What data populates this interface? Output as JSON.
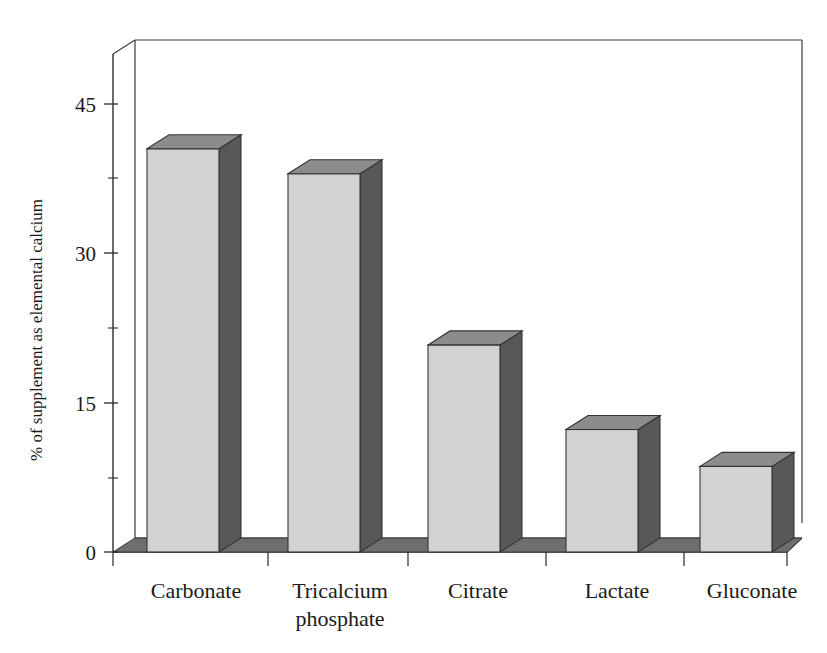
{
  "chart_data": {
    "type": "bar",
    "title": "",
    "subtitle": "",
    "xlabel": "",
    "ylabel": "% of supplement as elemental calcium",
    "categories": [
      "Carbonate",
      "Tricalcium phosphate",
      "Citrate",
      "Lactate",
      "Gluconate"
    ],
    "values": [
      40.5,
      38.0,
      20.8,
      12.3,
      8.6
    ],
    "series": [
      {
        "name": "% of supplement as elemental calcium",
        "values": [
          40.5,
          38.0,
          20.8,
          12.3,
          8.6
        ]
      }
    ],
    "ylim": [
      0,
      50
    ],
    "ytick_labels": [
      "0",
      "15",
      "30",
      "45"
    ],
    "ytick_values": [
      0,
      15,
      30,
      45
    ],
    "yminor_tick_values": [
      7.5,
      22.5,
      37.5
    ],
    "grid": false,
    "legend": false,
    "legend_position": "none",
    "style": "3d-column",
    "annotations": []
  },
  "axes": {
    "y_axis_label": "% of supplement as elemental calcium",
    "y_ticks": [
      {
        "label": "45",
        "value": 45
      },
      {
        "label": "30",
        "value": 30
      },
      {
        "label": "15",
        "value": 15
      },
      {
        "label": "0",
        "value": 0
      }
    ],
    "x_ticks": [
      {
        "label_line1": "Carbonate",
        "label_line2": ""
      },
      {
        "label_line1": "Tricalcium",
        "label_line2": "phosphate"
      },
      {
        "label_line1": "Citrate",
        "label_line2": ""
      },
      {
        "label_line1": "Lactate",
        "label_line2": ""
      },
      {
        "label_line1": "Gluconate",
        "label_line2": ""
      }
    ]
  },
  "colors": {
    "bar_front": "#d2d2d2",
    "bar_side": "#585858",
    "bar_top": "#8c8c8c",
    "floor": "#6e6e6e",
    "floor_front": "#565656",
    "axis": "#2b2b2b",
    "background": "#ffffff",
    "text": "#1a1a1a"
  }
}
